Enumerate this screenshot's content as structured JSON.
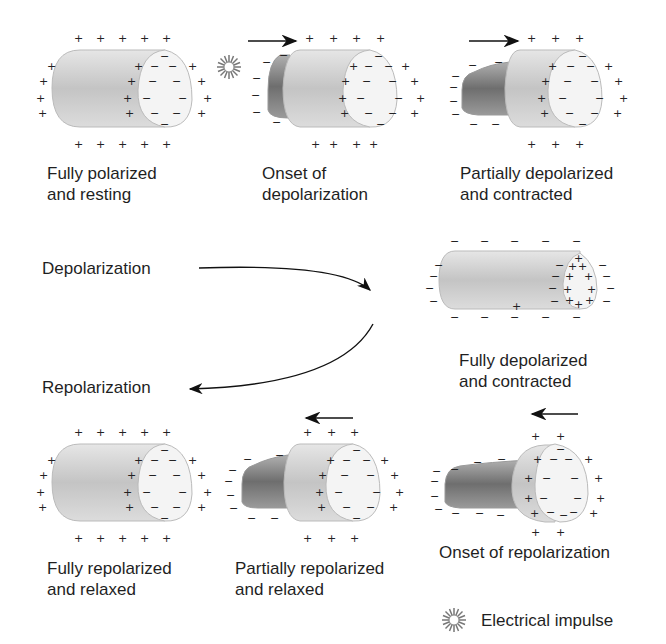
{
  "figure": {
    "type": "cardiac-cell-depolarization-repolarization-diagram",
    "panels": [
      {
        "id": "fully-polarized",
        "label_line1": "Fully polarized",
        "label_line2": "and resting"
      },
      {
        "id": "onset-depolarization",
        "label_line1": "Onset of",
        "label_line2": "depolarization"
      },
      {
        "id": "partially-depolarized",
        "label_line1": "Partially depolarized",
        "label_line2": "and contracted"
      },
      {
        "id": "fully-depolarized",
        "label_line1": "Fully depolarized",
        "label_line2": "and contracted"
      },
      {
        "id": "onset-repolarization",
        "label_line1": "Onset of repolarization",
        "label_line2": ""
      },
      {
        "id": "partially-repolarized",
        "label_line1": "Partially repolarized",
        "label_line2": "and relaxed"
      },
      {
        "id": "fully-repolarized",
        "label_line1": "Fully repolarized",
        "label_line2": "and relaxed"
      }
    ],
    "process_labels": {
      "depolarization": "Depolarization",
      "repolarization": "Repolarization"
    },
    "legend": {
      "icon": "starburst-icon",
      "label": "Electrical impulse"
    },
    "charges": {
      "positive": "+",
      "negative": "−"
    },
    "colors": {
      "cell_body": "#c8c8c8",
      "cell_end": "#f2f2f2",
      "contracted": "#8a8a8a",
      "text": "#1f1f1f"
    }
  }
}
